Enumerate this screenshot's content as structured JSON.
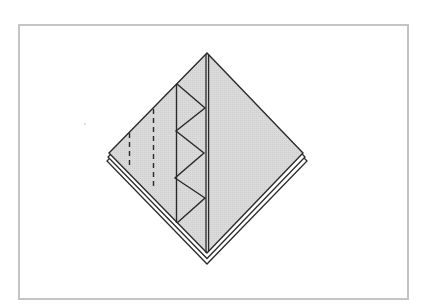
{
  "figure": {
    "type": "origami-folding-step",
    "colors": {
      "paper_fill": "#d9d9d9",
      "line": "#2a2a2a",
      "frame_border": "#c4c4c4",
      "background": "#ffffff"
    },
    "diamond": {
      "top": [
        207,
        53
      ],
      "left": [
        109,
        153
      ],
      "right": [
        303,
        153
      ],
      "bottom": [
        207,
        253
      ]
    },
    "lower_layers": [
      {
        "left": [
          108,
          157
        ],
        "right": [
          305,
          157
        ],
        "bottom": [
          207,
          258
        ]
      },
      {
        "left": [
          107,
          161
        ],
        "right": [
          307,
          161
        ],
        "bottom": [
          207,
          264
        ]
      }
    ],
    "center_lines_x": [
      206,
      208.5
    ],
    "zigzag": [
      [
        177,
        84
      ],
      [
        205,
        108
      ],
      [
        176,
        131
      ],
      [
        204,
        153
      ],
      [
        175,
        178
      ],
      [
        205,
        198
      ],
      [
        177,
        223
      ]
    ],
    "zigzag_spine_x": 176,
    "dashed_lines": [
      {
        "x": 129.5,
        "y1": 133,
        "y2": 167
      },
      {
        "x": 153.5,
        "y1": 109,
        "y2": 190
      }
    ],
    "stray_mark": [
      85,
      124
    ]
  }
}
